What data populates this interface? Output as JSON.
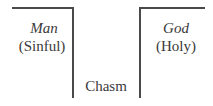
{
  "diagram": {
    "left": {
      "title": "Man",
      "subtitle": "(Sinful)"
    },
    "right": {
      "title": "God",
      "subtitle": "(Holy)"
    },
    "gap_label": "Chasm"
  }
}
